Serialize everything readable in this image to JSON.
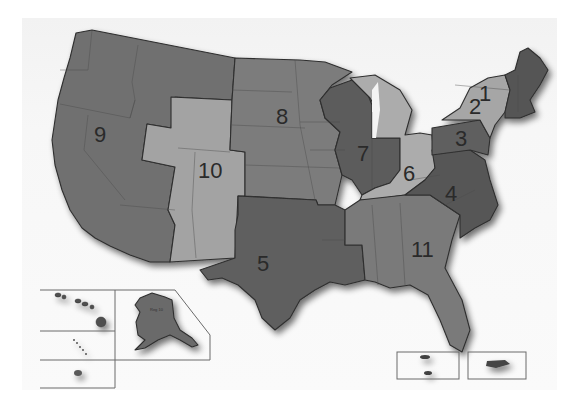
{
  "map": {
    "title": "",
    "type": "US regional map (11 regions)",
    "colors": {
      "dark": "#5e5e5e",
      "medium": "#7c7c7c",
      "light": "#a9a9a9",
      "border": "#2f2f2f",
      "background": "#ffffff"
    },
    "regions": [
      {
        "id": "1",
        "label": "1",
        "shade": "dark",
        "area": "New England"
      },
      {
        "id": "2",
        "label": "2",
        "shade": "light",
        "area": "New York / New Jersey"
      },
      {
        "id": "3",
        "label": "3",
        "shade": "dark",
        "area": "Pennsylvania"
      },
      {
        "id": "4",
        "label": "4",
        "shade": "dark",
        "area": "Mid-Atlantic / Carolinas"
      },
      {
        "id": "5",
        "label": "5",
        "shade": "dark",
        "area": "Texas / Louisiana / Arkansas"
      },
      {
        "id": "6",
        "label": "6",
        "shade": "light",
        "area": "Ohio Valley"
      },
      {
        "id": "7",
        "label": "7",
        "shade": "dark",
        "area": "Wisconsin / Illinois / Indiana"
      },
      {
        "id": "8",
        "label": "8",
        "shade": "medium",
        "area": "Northern Plains"
      },
      {
        "id": "9",
        "label": "9",
        "shade": "medium",
        "area": "Pacific West"
      },
      {
        "id": "10",
        "label": "10",
        "shade": "light",
        "area": "Mountain West"
      },
      {
        "id": "11",
        "label": "11",
        "shade": "medium",
        "area": "Southeast"
      }
    ],
    "insets": {
      "alaska_label": "Reg 10",
      "boxes": [
        "Hawaii",
        "Pacific islands",
        "American Samoa",
        "Alaska",
        "US Virgin Islands",
        "Puerto Rico"
      ]
    }
  }
}
